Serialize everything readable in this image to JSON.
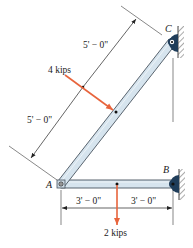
{
  "diagram": {
    "type": "two-member frame / truss statics problem",
    "points": {
      "A": {
        "label": "A"
      },
      "B": {
        "label": "B"
      },
      "C": {
        "label": "C"
      }
    },
    "members": [
      {
        "name": "AC",
        "from": "A",
        "to": "C",
        "orientation": "diagonal"
      },
      {
        "name": "AB",
        "from": "A",
        "to": "B",
        "orientation": "horizontal"
      }
    ],
    "supports": [
      {
        "point": "C",
        "type": "pin to wall"
      },
      {
        "point": "B",
        "type": "pin to wall"
      }
    ],
    "loads": [
      {
        "label": "4 kips",
        "member": "AC",
        "location": "midspan",
        "direction": "perpendicular to AC"
      },
      {
        "label": "2 kips",
        "member": "AB",
        "location": "midspan",
        "direction": "downward"
      }
    ],
    "dimensions": {
      "ac_upper": "5' − 0\"",
      "ac_lower": "5' − 0\"",
      "ab_left": "3' − 0\"",
      "ab_right": "3' − 0\""
    },
    "colors": {
      "member_fill": "#d6e4ee",
      "member_stroke": "#4a5560",
      "load_arrow": "#e8643c",
      "support": "#1f3d5a",
      "dim_line": "#333333"
    }
  }
}
